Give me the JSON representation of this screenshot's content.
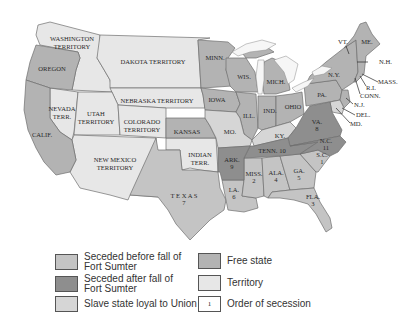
{
  "colors": {
    "seceded_before": "#c4c4c4",
    "seceded_after": "#8e8e8e",
    "slave_loyal": "#d6d6d6",
    "free_state": "#b3b3b3",
    "territory": "#e7e7e7",
    "order_box": "#ffffff"
  },
  "map": {
    "territories": {
      "washington": "WASHINGTON",
      "washington2": "TERRITORY",
      "dakota": "DAKOTA TERRITORY",
      "nebraska": "NEBRASKA TERRITORY",
      "nevada": "NEVADA",
      "nevada2": "TERR.",
      "utah": "UTAH",
      "utah2": "TERRITORY",
      "colorado": "COLORADO",
      "colorado2": "TERRITORY",
      "new_mexico": "NEW MEXICO",
      "new_mexico2": "TERRITORY",
      "indian": "INDIAN",
      "indian2": "TERR."
    },
    "free_states": {
      "oregon": "OREGON",
      "california": "CALIF.",
      "minnesota": "MINN.",
      "wisconsin": "WIS.",
      "iowa": "IOWA",
      "kansas": "KANSAS",
      "illinois": "ILL.",
      "indiana": "IND.",
      "ohio": "OHIO",
      "michigan": "MICH.",
      "pennsylvania": "PA.",
      "new_york": "N.Y.",
      "vermont": "VT.",
      "maine": "ME.",
      "new_hampshire": "N.H.",
      "massachusetts": "MASS.",
      "rhode_island": "R.I.",
      "connecticut": "CONN.",
      "new_jersey": "N.J."
    },
    "slave_loyal_states": {
      "missouri": "MO.",
      "kentucky": "KY.",
      "delaware": "DEL.",
      "maryland": "MD."
    },
    "seceded_states": [
      {
        "abbr": "S.C.",
        "order": "1",
        "group": "before"
      },
      {
        "abbr": "MISS.",
        "order": "2",
        "group": "before"
      },
      {
        "abbr": "FLA.",
        "order": "3",
        "group": "before"
      },
      {
        "abbr": "ALA.",
        "order": "4",
        "group": "before"
      },
      {
        "abbr": "GA.",
        "order": "5",
        "group": "before"
      },
      {
        "abbr": "LA.",
        "order": "6",
        "group": "before"
      },
      {
        "abbr": "T E X A S",
        "order": "7",
        "group": "before"
      },
      {
        "abbr": "VA.",
        "order": "8",
        "group": "after"
      },
      {
        "abbr": "ARK.",
        "order": "9",
        "group": "after"
      },
      {
        "abbr": "TENN. 10",
        "order": "10",
        "group": "after"
      },
      {
        "abbr": "N.C.",
        "order": "11",
        "group": "after"
      }
    ]
  },
  "legend": {
    "items": [
      {
        "label_line1": "Seceded before fall of",
        "label_line2": "Fort Sumter"
      },
      {
        "label_line1": "Seceded after fall of",
        "label_line2": "Fort Sumter"
      },
      {
        "label": "Slave state loyal to Union"
      },
      {
        "label": "Free state"
      },
      {
        "label": "Territory"
      },
      {
        "label": "Order of secession",
        "box_value": "1"
      }
    ]
  }
}
